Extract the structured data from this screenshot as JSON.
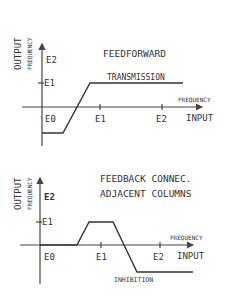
{
  "colors": {
    "ink": "#333333",
    "background": "#ffffff"
  },
  "top_panel": {
    "title": "FEEDFORWARD",
    "curve_label": "TRANSMISSION",
    "y_axis": {
      "label_main": "OUTPUT",
      "label_sub": "FREQUENCY",
      "ticks": [
        "E2",
        "E1"
      ]
    },
    "x_axis": {
      "label_main": "INPUT",
      "label_sub": "FREQUENCY",
      "ticks": [
        "E0",
        "E1",
        "E2"
      ]
    }
  },
  "bottom_panel": {
    "title_line1": "FEEDBACK CONNEC.",
    "title_line2": "ADJACENT COLUMNS",
    "curve_label": "INHIBITION",
    "y_axis": {
      "label_main": "OUTPUT",
      "label_sub": "FREQUENCY",
      "ticks": [
        "E2",
        "E1"
      ]
    },
    "x_axis": {
      "label_main": "INPUT",
      "label_sub": "FREQUENCY",
      "ticks": [
        "E0",
        "E1",
        "E2"
      ]
    }
  }
}
